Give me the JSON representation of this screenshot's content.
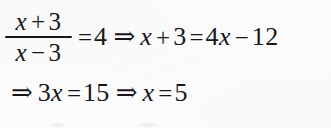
{
  "document": {
    "type": "scanned-math-solution",
    "background_color": "#fcfcfd",
    "text_color": "#17171a"
  },
  "equation": {
    "line1": {
      "fraction": {
        "numerator": {
          "variable": "x",
          "operator": "+",
          "number": "3"
        },
        "denominator": {
          "variable": "x",
          "operator": "−",
          "number": "3"
        }
      },
      "equals1": "=",
      "value1": "4",
      "implies1": "⇒",
      "lhs_variable": "x",
      "lhs_operator": "+",
      "lhs_number": "3",
      "equals2": "=",
      "rhs_coefficient": "4",
      "rhs_variable": "x",
      "rhs_operator": "−",
      "rhs_number": "12"
    },
    "line2": {
      "implies1": "⇒",
      "coefficient": "3",
      "variable1": "x",
      "equals1": "=",
      "value1": "15",
      "implies2": "⇒",
      "variable2": "x",
      "equals2": "=",
      "solution": "5"
    }
  }
}
